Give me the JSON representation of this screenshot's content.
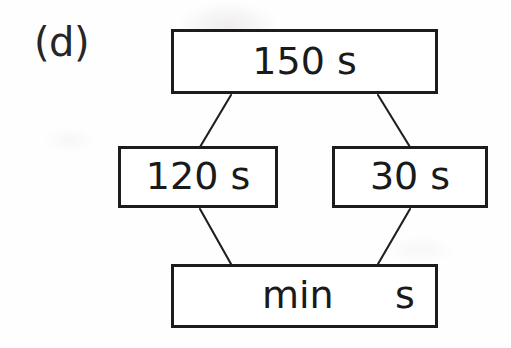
{
  "figure": {
    "panel_label": "(d)",
    "type": "part-whole-bar-model"
  },
  "nodes": {
    "total": {
      "label": "150 s",
      "role": "whole"
    },
    "part_left": {
      "label": "120 s",
      "role": "part"
    },
    "part_right": {
      "label": "30 s",
      "role": "part"
    },
    "answer": {
      "unit_minutes": "min",
      "unit_seconds": "s",
      "role": "answer-blank"
    }
  },
  "connectors": [
    {
      "name": "total-to-part-left",
      "from": "total",
      "to": "part_left"
    },
    {
      "name": "total-to-part-right",
      "from": "total",
      "to": "part_right"
    },
    {
      "name": "part-left-to-answer",
      "from": "part_left",
      "to": "answer"
    },
    {
      "name": "part-right-to-answer",
      "from": "part_right",
      "to": "answer"
    }
  ],
  "colors": {
    "ink": "#1c1c1c",
    "text": "#1a1a1a",
    "paper": "#fefefe"
  }
}
